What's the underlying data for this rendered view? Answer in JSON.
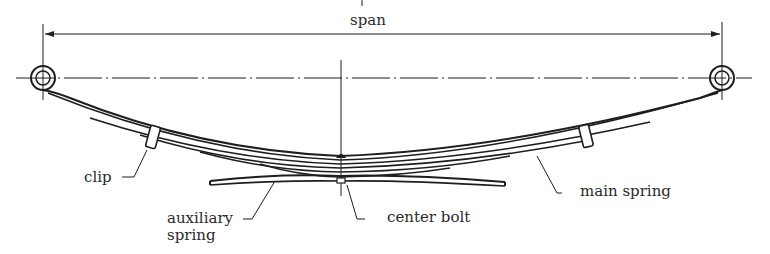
{
  "diagram": {
    "labels": {
      "span": "span",
      "clip": "clip",
      "auxiliary_spring_line1": "auxiliary",
      "auxiliary_spring_line2": "spring",
      "center_bolt": "center bolt",
      "main_spring": "main spring"
    },
    "components": [
      "spring eye (left)",
      "spring eye (right)",
      "main spring leaves",
      "clip (left)",
      "clip (right)",
      "center bolt",
      "auxiliary spring"
    ],
    "colors": {
      "ink": "#1e1e1e",
      "background": "#ffffff"
    }
  }
}
